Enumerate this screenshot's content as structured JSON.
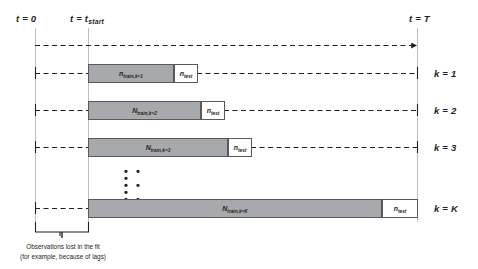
{
  "figure": {
    "type": "rolling-origin-cross-validation-schematic",
    "background_color": "#ffffff",
    "train_fill": "#a7a9ac",
    "test_fill": "#ffffff",
    "stroke_color": "#58595b"
  },
  "axis": {
    "start_label": "t = 0",
    "origin_label_prefix": "t = t",
    "origin_label_sub": "start",
    "end_label": "t = T"
  },
  "rows": [
    {
      "k_label": "k = 1",
      "train": {
        "prefix": "n",
        "sub": "train,k=1"
      },
      "test": {
        "prefix": "n",
        "sub": "test"
      }
    },
    {
      "k_label": "k = 2",
      "train": {
        "prefix": "N",
        "sub": "train,k=2"
      },
      "test": {
        "prefix": "n",
        "sub": "test"
      }
    },
    {
      "k_label": "k = 3",
      "train": {
        "prefix": "N",
        "sub": "train,k=3"
      },
      "test": {
        "prefix": "n",
        "sub": "test"
      }
    },
    {
      "k_label": "k = K",
      "train": {
        "prefix": "N",
        "sub": "train,k=K"
      },
      "test": {
        "prefix": "n",
        "sub": "test"
      }
    }
  ],
  "ellipsis": {
    "row1": "• • •",
    "row2": "• • •",
    "row3": "• • •"
  },
  "annotation": {
    "line1": "Observations lost in the fit",
    "line2": "(for example, because of lags)"
  }
}
